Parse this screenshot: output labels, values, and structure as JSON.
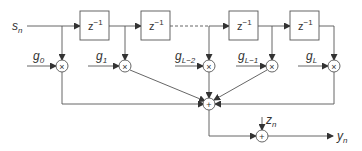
{
  "diagram": {
    "input": {
      "label": "s",
      "sub": "n"
    },
    "output": {
      "label": "y",
      "sub": "n"
    },
    "noise": {
      "label": "z",
      "sub": "n"
    },
    "delays": [
      {
        "label": "z",
        "sup": "−1"
      },
      {
        "label": "z",
        "sup": "−1"
      },
      {
        "label": "z",
        "sup": "−1"
      },
      {
        "label": "z",
        "sup": "−1"
      }
    ],
    "gains": [
      {
        "label": "g",
        "sub": "0"
      },
      {
        "label": "g",
        "sub": "1"
      },
      {
        "label": "g",
        "sub": "L−2"
      },
      {
        "label": "g",
        "sub": "L−1"
      },
      {
        "label": "g",
        "sub": "L"
      }
    ],
    "multiplier_symbol": "×",
    "adder_symbol": "+",
    "colors": {
      "line": "#444444",
      "box_border": "#555555",
      "text": "#333333"
    }
  }
}
